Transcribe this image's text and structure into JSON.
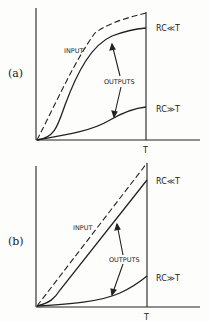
{
  "panels": [
    {
      "label": "(a)",
      "input_label": "INPUT",
      "outputs_label": "OUTPUTS",
      "upper_curve_label": "RC≪T",
      "lower_curve_label": "RC≫T",
      "time_label": "T"
    },
    {
      "label": "(b)",
      "input_label": "INPUT",
      "outputs_label": "OUTPUTS",
      "upper_curve_label": "RC≪T",
      "lower_curve_label": "RC≫T",
      "time_label": "T"
    }
  ],
  "colors": {
    "ink": "#222222",
    "paper": "#fdfdfb"
  }
}
